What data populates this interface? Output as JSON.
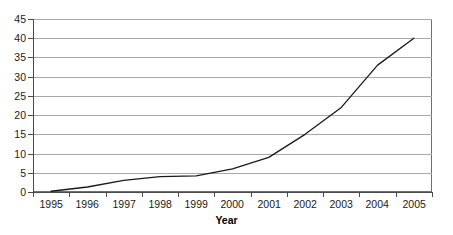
{
  "chart_data": {
    "type": "line",
    "title": "",
    "xlabel": "Year",
    "ylabel": "",
    "categories": [
      "1995",
      "1996",
      "1997",
      "1998",
      "1999",
      "2000",
      "2001",
      "2002",
      "2003",
      "2004",
      "2005"
    ],
    "values": [
      0.2,
      1.3,
      3.0,
      4.0,
      4.2,
      6.0,
      9.0,
      15.0,
      22.0,
      33.0,
      40.0
    ],
    "series": [
      {
        "name": "",
        "values": [
          0.2,
          1.3,
          3.0,
          4.0,
          4.2,
          6.0,
          9.0,
          15.0,
          22.0,
          33.0,
          40.0
        ]
      }
    ],
    "ylim": [
      0,
      45
    ],
    "ytick_step": 5,
    "yticks": [
      0,
      5,
      10,
      15,
      20,
      25,
      30,
      35,
      40,
      45
    ],
    "ytick_labels": [
      "0",
      "5",
      "10",
      "15",
      "20",
      "25",
      "30",
      "35",
      "40",
      "45"
    ],
    "grid": true,
    "grid_axis": "y",
    "legend": false,
    "legend_position": "none",
    "markers": false,
    "line_color": "#1a1a1a",
    "grid_color": "#a8a8a8",
    "axis_color": "#4a4a4a",
    "background": "#ffffff"
  }
}
